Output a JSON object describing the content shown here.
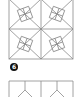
{
  "figure": {
    "type": "quilt-block-diagram",
    "top_block": {
      "description": "square star block with rotated 2x2 grid squares in each quadrant",
      "quadrant_count": 4
    },
    "step_badge": {
      "label": "6",
      "color": "#111111"
    },
    "bottom_block": {
      "description": "partial row of two panels each with a Y-shaped seam",
      "panel_count": 2
    },
    "colors": {
      "line": "#8a8a8a",
      "background": "#ffffff"
    }
  }
}
